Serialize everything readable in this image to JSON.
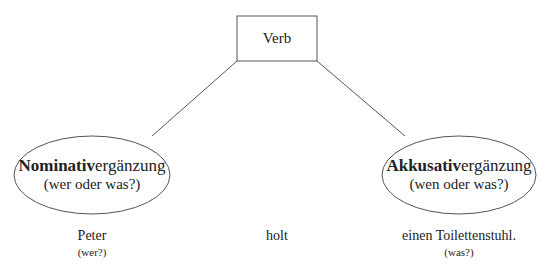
{
  "diagram": {
    "verb_box": {
      "label": "Verb"
    },
    "nodes": [
      {
        "id": "nominativ",
        "bold": "Nominativ",
        "rest": "ergänzung",
        "question": "(wer oder was?)"
      },
      {
        "id": "akkusativ",
        "bold": "Akkusativ",
        "rest": "ergänzung",
        "question": "(wen oder was?)"
      }
    ],
    "sentence": [
      {
        "word": "Peter",
        "hint": "(wer?)"
      },
      {
        "word": "holt",
        "hint": ""
      },
      {
        "word": "einen Toilettenstuhl.",
        "hint": "(was?)"
      }
    ],
    "colors": {
      "stroke": "#555555",
      "text": "#222222",
      "background": "#ffffff"
    }
  }
}
